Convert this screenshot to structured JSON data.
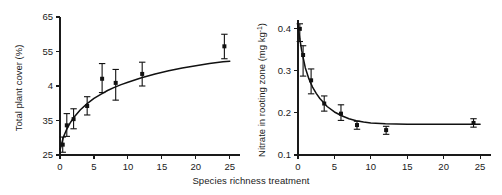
{
  "figure": {
    "shared_xlabel": "Species richness treatment"
  },
  "chart_data": [
    {
      "type": "scatter",
      "panel": "left",
      "title": "",
      "xlabel": "Species richness treatment",
      "ylabel": "Total plant cover (%)",
      "xlim": [
        0,
        26.5
      ],
      "ylim": [
        25,
        65
      ],
      "xticks": [
        0,
        5,
        10,
        15,
        20,
        25
      ],
      "xticklabels": [
        "0",
        "5",
        "10",
        "15",
        "20",
        "25"
      ],
      "yticks": [
        25,
        35,
        45,
        55,
        65
      ],
      "yticklabels": [
        "25",
        "35",
        "4",
        "55",
        "65"
      ],
      "grid": false,
      "legend": null,
      "x": [
        0.4,
        1.0,
        2.0,
        4.0,
        6.2,
        8.2,
        12.1,
        24.2
      ],
      "y": [
        28.0,
        33.6,
        35.4,
        39.2,
        47.1,
        45.9,
        48.5,
        56.5
      ],
      "yerr_low": [
        2.2,
        3.2,
        2.8,
        2.6,
        4.0,
        5.0,
        3.5,
        3.6
      ],
      "yerr_high": [
        2.2,
        3.4,
        3.0,
        2.7,
        4.4,
        3.9,
        3.4,
        3.5
      ],
      "fit_curve": {
        "type": "asymptotic",
        "x": [
          0.0,
          0.5,
          1.0,
          1.5,
          2.0,
          3.0,
          4.0,
          5.0,
          6.0,
          7.0,
          8.0,
          9.0,
          10.0,
          12.0,
          14.0,
          16.0,
          18.0,
          20.0,
          22.0,
          24.0,
          25.0
        ],
        "y": [
          26.4,
          30.2,
          32.5,
          34.3,
          35.8,
          38.1,
          39.9,
          41.4,
          42.6,
          43.7,
          44.6,
          45.4,
          46.1,
          47.4,
          48.5,
          49.4,
          50.2,
          50.9,
          51.5,
          52.0,
          52.2
        ]
      }
    },
    {
      "type": "scatter",
      "panel": "right",
      "title": "",
      "xlabel": "Species richness treatment",
      "ylabel": "Nitrate in rooting zone (mg kg",
      "ylabel_sup": "-1",
      "ylabel_tail": ")",
      "xlim": [
        0,
        26.5
      ],
      "ylim": [
        0.1,
        0.42
      ],
      "xticks": [
        0,
        5,
        10,
        15,
        20,
        25
      ],
      "xticklabels": [
        "0",
        "5",
        "10",
        "15",
        "20",
        "25"
      ],
      "yticks": [
        0.1,
        0.2,
        0.3,
        0.4
      ],
      "yticklabels": [
        "0.1",
        "0.2",
        "0.3",
        "0.4"
      ],
      "grid": false,
      "legend": null,
      "x": [
        0.25,
        0.7,
        1.8,
        3.6,
        5.9,
        8.1,
        12.1,
        24.1
      ],
      "y": [
        0.399,
        0.337,
        0.277,
        0.222,
        0.198,
        0.171,
        0.159,
        0.176
      ],
      "yerr_low": [
        0.03,
        0.05,
        0.032,
        0.018,
        0.016,
        0.01,
        0.01,
        0.01
      ],
      "yerr_high": [
        0.012,
        0.022,
        0.027,
        0.018,
        0.021,
        0.009,
        0.009,
        0.01
      ],
      "fit_curve": {
        "type": "exponential-decay",
        "x": [
          0.0,
          0.25,
          0.5,
          1.0,
          1.5,
          2.0,
          2.5,
          3.0,
          4.0,
          5.0,
          6.0,
          7.0,
          8.0,
          9.0,
          10.0,
          12.0,
          15.0,
          18.0,
          21.0,
          24.0,
          25.0
        ],
        "y": [
          0.408,
          0.375,
          0.348,
          0.307,
          0.28,
          0.261,
          0.246,
          0.234,
          0.215,
          0.202,
          0.193,
          0.186,
          0.181,
          0.178,
          0.176,
          0.174,
          0.173,
          0.173,
          0.173,
          0.173,
          0.173
        ]
      }
    }
  ]
}
